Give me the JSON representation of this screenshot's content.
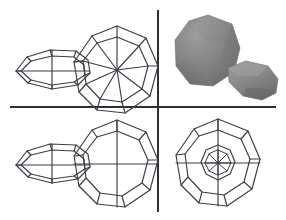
{
  "figure": {
    "background_color": "#ffffff",
    "line_color": "#3c3c44",
    "divider_color": "#2f2f35",
    "canvas": {
      "width": 286,
      "height": 220
    },
    "layout": "2x2 quadrant grid",
    "divider": {
      "vertical_x": 158,
      "horizontal_y": 107
    }
  },
  "panels": [
    {
      "id": "top-left",
      "label": "Wireframe triangulated mesh view",
      "render_mode": "wireframe",
      "objects": [
        "elongated-polyhedron",
        "round-polyhedron"
      ]
    },
    {
      "id": "top-right",
      "label": "Shaded solid render view",
      "render_mode": "shaded",
      "objects": [
        "round-polyhedron",
        "elongated-polyhedron"
      ],
      "fill_light": "#9a9a9a",
      "fill_mid": "#808080",
      "fill_dark": "#636363"
    },
    {
      "id": "bottom-left",
      "label": "Wireframe silhouette view",
      "render_mode": "wireframe",
      "objects": [
        "elongated-polyhedron",
        "round-polyhedron"
      ]
    },
    {
      "id": "bottom-right",
      "label": "Wireframe nested axial view",
      "render_mode": "wireframe",
      "objects": [
        "round-polyhedron-axial"
      ]
    }
  ],
  "chart_data": {
    "type": "scatter",
    "xlabel": "",
    "ylabel": "",
    "panel_count": 4,
    "shapes": {
      "elongated_polyhedron": {
        "description": "Elongated faceted solid, horizontal major axis",
        "outer_ring_points": [
          [
            16,
            71
          ],
          [
            26,
            57
          ],
          [
            50,
            50
          ],
          [
            76,
            51
          ],
          [
            88,
            60
          ],
          [
            90,
            73
          ],
          [
            78,
            84
          ],
          [
            52,
            88
          ],
          [
            28,
            83
          ]
        ],
        "inner_ring_points": [
          [
            20,
            71
          ],
          [
            30,
            61
          ],
          [
            52,
            55
          ],
          [
            74,
            56
          ],
          [
            84,
            64
          ],
          [
            85,
            74
          ],
          [
            74,
            81
          ],
          [
            52,
            84
          ],
          [
            30,
            80
          ]
        ],
        "axis_horizontal": [
          [
            16,
            71
          ],
          [
            90,
            71
          ]
        ],
        "axis_vertical": [
          [
            52,
            50
          ],
          [
            52,
            88
          ]
        ]
      },
      "round_polyhedron": {
        "description": "Near-spherical faceted solid, 9-sided silhouette with 8 radial spokes",
        "center": [
          117,
          70
        ],
        "outer_radius": 44,
        "inner_radius": 33,
        "silhouette_sides": 9,
        "spokes": 8
      },
      "round_polyhedron_axial": {
        "description": "Axial view, nested outer and inner polygon rings with central star",
        "center": [
          218,
          163
        ],
        "outer_radius": 45,
        "mid_radius": 34,
        "inner_radius": 18,
        "core_radius": 12,
        "silhouette_sides": 9,
        "spokes": 8
      }
    }
  }
}
